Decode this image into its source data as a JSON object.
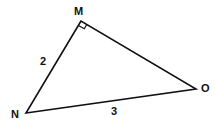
{
  "diagram": {
    "type": "right-triangle",
    "vertices": [
      {
        "name": "M",
        "x": 81,
        "y": 21,
        "label_x": 74,
        "label_y": 15
      },
      {
        "name": "N",
        "x": 26,
        "y": 113,
        "label_x": 11,
        "label_y": 118
      },
      {
        "name": "O",
        "x": 196,
        "y": 89,
        "label_x": 201,
        "label_y": 92
      }
    ],
    "right_angle_at": "M",
    "sides": [
      {
        "between": "MN",
        "label": "2",
        "label_x": 41,
        "label_y": 64
      },
      {
        "between": "NO",
        "label": "3",
        "label_x": 111,
        "label_y": 114
      },
      {
        "between": "MO",
        "label": ""
      }
    ],
    "stroke_color": "#111111"
  }
}
